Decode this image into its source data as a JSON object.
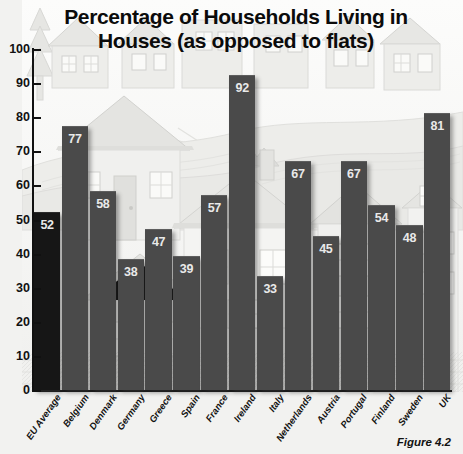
{
  "chart_data": {
    "type": "bar",
    "title": "Percentage of Households Living in Houses (as opposed to flats)",
    "title_line1": "Percentage of Households Living in",
    "title_line2": "Houses (as opposed to flats)",
    "xlabel": "",
    "ylabel": "",
    "ylim": [
      0,
      100
    ],
    "ytick_step": 10,
    "yticks": [
      "0",
      "10",
      "20",
      "30",
      "40",
      "50",
      "60",
      "70",
      "80",
      "90",
      "100"
    ],
    "grid": false,
    "legend": "none",
    "categories": [
      "EU Average",
      "Belgium",
      "Denmark",
      "Germany",
      "Greece",
      "Spain",
      "France",
      "Ireland",
      "Italy",
      "Netherlands",
      "Austria",
      "Portugal",
      "Finland",
      "Sweden",
      "UK"
    ],
    "values": [
      52,
      77,
      58,
      38,
      47,
      39,
      57,
      92,
      33,
      67,
      45,
      67,
      54,
      48,
      81
    ],
    "highlight_index": 0,
    "bar_color": "#4a4a4a",
    "highlight_color": "#161616",
    "value_label_color": "#e9e9e9",
    "axis_color": "#111111",
    "background_style": "grayscale illustration of houses"
  },
  "caption": {
    "text": "Figure 4.2"
  }
}
